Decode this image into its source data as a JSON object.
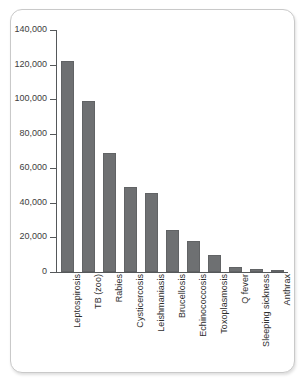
{
  "chart_data": {
    "type": "bar",
    "title": "",
    "subtitle": "",
    "xlabel": "",
    "ylabel": "",
    "ylim": [
      0,
      140000
    ],
    "grid": false,
    "legend": null,
    "y_ticks": [
      {
        "value": 0,
        "label": "0"
      },
      {
        "value": 20000,
        "label": "20,000"
      },
      {
        "value": 40000,
        "label": "40,000"
      },
      {
        "value": 60000,
        "label": "60,000"
      },
      {
        "value": 80000,
        "label": "80,000"
      },
      {
        "value": 100000,
        "label": "100,000"
      },
      {
        "value": 120000,
        "label": "120,000"
      },
      {
        "value": 140000,
        "label": "140,000"
      }
    ],
    "categories": [
      "Leptospirosis",
      "TB (zoo)",
      "Rabies",
      "Cysticercosis",
      "Leishmaniasis",
      "Brucellosis",
      "Echinococcosis",
      "Toxoplasmosis",
      "Q fever",
      "Sleeping sickness",
      "Anthrax"
    ],
    "values": [
      122000,
      99000,
      69000,
      49000,
      46000,
      24500,
      18000,
      10000,
      3000,
      2000,
      1000
    ],
    "bar_color": "#6e7072",
    "axis_color": "#55585a"
  }
}
